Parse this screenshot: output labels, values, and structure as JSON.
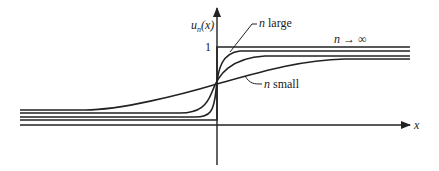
{
  "figure": {
    "y_axis_label_base": "u",
    "y_axis_label_sub": "n",
    "y_axis_label_arg": "(x)",
    "x_axis_label": "x",
    "y_tick_label": "1",
    "annotations": {
      "n_large": {
        "var": "n",
        "text": " large"
      },
      "n_small": {
        "var": "n",
        "text": " small"
      },
      "n_infinity": {
        "var": "n",
        "arrow": " → ",
        "text": "∞"
      }
    },
    "colors": {
      "ink": "#222222",
      "background": "#ffffff"
    }
  }
}
